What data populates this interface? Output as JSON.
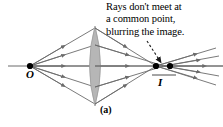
{
  "figure": {
    "panel_label": "(a)",
    "annotation": {
      "lines": [
        "Rays don't meet at",
        "a common point,",
        "blurring the image."
      ]
    },
    "labels": {
      "object_point": "O",
      "image_point": "I"
    },
    "colors": {
      "stroke": "#6b6b6b",
      "axis": "#6b6b6b",
      "lens_fill": "#b6b6b6",
      "lens_stroke": "#9a9a9a",
      "point_fill": "#000000",
      "text": "#000000",
      "background": "#ffffff"
    },
    "geometry": {
      "axis_y": 66,
      "axis_x_start": 8,
      "axis_x_end": 223,
      "object_x": 30,
      "lens_center_x": 95,
      "lens_half_height": 40,
      "lens_half_width": 9,
      "image_point_1_x": 156,
      "image_point_2_x": 170
    }
  }
}
